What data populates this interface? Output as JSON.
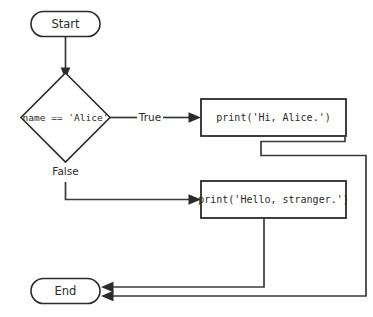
{
  "diagram": {
    "type": "flowchart",
    "title": "",
    "background_color": "#ffffff",
    "stroke_color": "#2b2b2b",
    "nodes": [
      {
        "id": "start",
        "shape": "terminal",
        "label": "Start"
      },
      {
        "id": "decision",
        "shape": "diamond",
        "label": "name == 'Alice'"
      },
      {
        "id": "print_hi",
        "shape": "process",
        "label": "print('Hi, Alice.')"
      },
      {
        "id": "print_hello",
        "shape": "process",
        "label": "print('Hello, stranger.')"
      },
      {
        "id": "end",
        "shape": "terminal",
        "label": "End"
      }
    ],
    "edges": [
      {
        "id": "start-to-decision",
        "from": "start",
        "to": "decision",
        "label": ""
      },
      {
        "id": "decision-true",
        "from": "decision",
        "to": "print_hi",
        "label": "True"
      },
      {
        "id": "decision-false",
        "from": "decision",
        "to": "print_hello",
        "label": "False"
      },
      {
        "id": "print-hi-to-end",
        "from": "print_hi",
        "to": "end",
        "label": ""
      },
      {
        "id": "print-hello-to-end",
        "from": "print_hello",
        "to": "end",
        "label": ""
      }
    ]
  }
}
